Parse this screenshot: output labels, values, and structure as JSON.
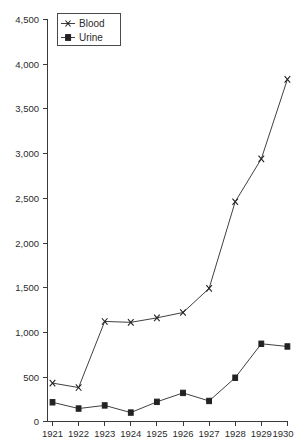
{
  "chart_data": {
    "type": "line",
    "title": "",
    "subtitle": "",
    "xlabel": "",
    "ylabel": "",
    "x": [
      1921,
      1922,
      1923,
      1924,
      1925,
      1926,
      1927,
      1928,
      1929,
      1930
    ],
    "categories": [
      "1921",
      "1922",
      "1923",
      "1924",
      "1925",
      "1926",
      "1927",
      "1928",
      "1929",
      "1930"
    ],
    "series": [
      {
        "name": "Blood",
        "marker": "x-marker",
        "color": "#404040",
        "values": [
          430,
          380,
          1120,
          1110,
          1160,
          1220,
          1490,
          2460,
          2940,
          3830
        ]
      },
      {
        "name": "Urine",
        "marker": "square-marker",
        "color": "#404040",
        "values": [
          215,
          145,
          180,
          100,
          220,
          320,
          230,
          490,
          870,
          840
        ]
      }
    ],
    "ylim": [
      0,
      4500
    ],
    "yticks": [
      0,
      500,
      1000,
      1500,
      2000,
      2500,
      3000,
      3500,
      4000,
      4500
    ],
    "ytick_labels": [
      "0",
      "500",
      "1,000",
      "1,500",
      "2,000",
      "2,500",
      "3,000",
      "3,500",
      "4,000",
      "4,500"
    ],
    "xlim": [
      1921,
      1930
    ],
    "xtick_labels": [
      "1921",
      "1922",
      "1923",
      "1924",
      "1925",
      "1926",
      "1927",
      "1928",
      "1929",
      "1930"
    ],
    "grid": false,
    "legend": {
      "position": "upper-left-inside",
      "entries": [
        {
          "label": "Blood",
          "marker": "x-marker"
        },
        {
          "label": "Urine",
          "marker": "square-marker"
        }
      ]
    },
    "axis_color": "#3a3a3a",
    "background": "#ffffff"
  }
}
